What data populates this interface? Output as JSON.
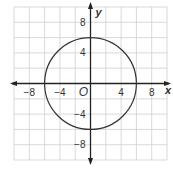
{
  "chart_data": {
    "type": "scatter",
    "title": "",
    "xlabel": "x",
    "ylabel": "y",
    "origin_label": "O",
    "xlim": [
      -10,
      10
    ],
    "ylim": [
      -10,
      10
    ],
    "grid": true,
    "grid_step": 2,
    "x_ticks": [
      {
        "value": -8,
        "label": "−8"
      },
      {
        "value": -4,
        "label": "−4"
      },
      {
        "value": 4,
        "label": "4"
      },
      {
        "value": 8,
        "label": "8"
      }
    ],
    "y_ticks": [
      {
        "value": 8,
        "label": "8"
      },
      {
        "value": 4,
        "label": "4"
      },
      {
        "value": -4,
        "label": "−4"
      },
      {
        "value": -8,
        "label": "−8"
      }
    ],
    "shapes": [
      {
        "kind": "circle",
        "center": [
          0,
          0
        ],
        "radius": 6,
        "equation": "x^2 + y^2 = 36"
      }
    ],
    "colors": {
      "grid": "#cfcfcf",
      "axis": "#222222",
      "curve": "#333333",
      "text": "#333333"
    }
  }
}
